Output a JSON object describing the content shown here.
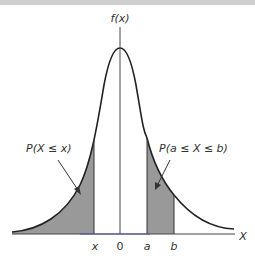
{
  "diagram": {
    "y_axis_label": "f(x)",
    "x_axis_label": "X",
    "tick_labels": {
      "x": "x",
      "zero": "0",
      "a": "a",
      "b": "b"
    },
    "annotations": {
      "left_area": "P(X ≤ x)",
      "right_area": "P(a ≤ X ≤ b)"
    },
    "colors": {
      "shade": "#999999",
      "curve": "#222222",
      "axis": "#333333",
      "baseline": "#5555aa"
    }
  }
}
